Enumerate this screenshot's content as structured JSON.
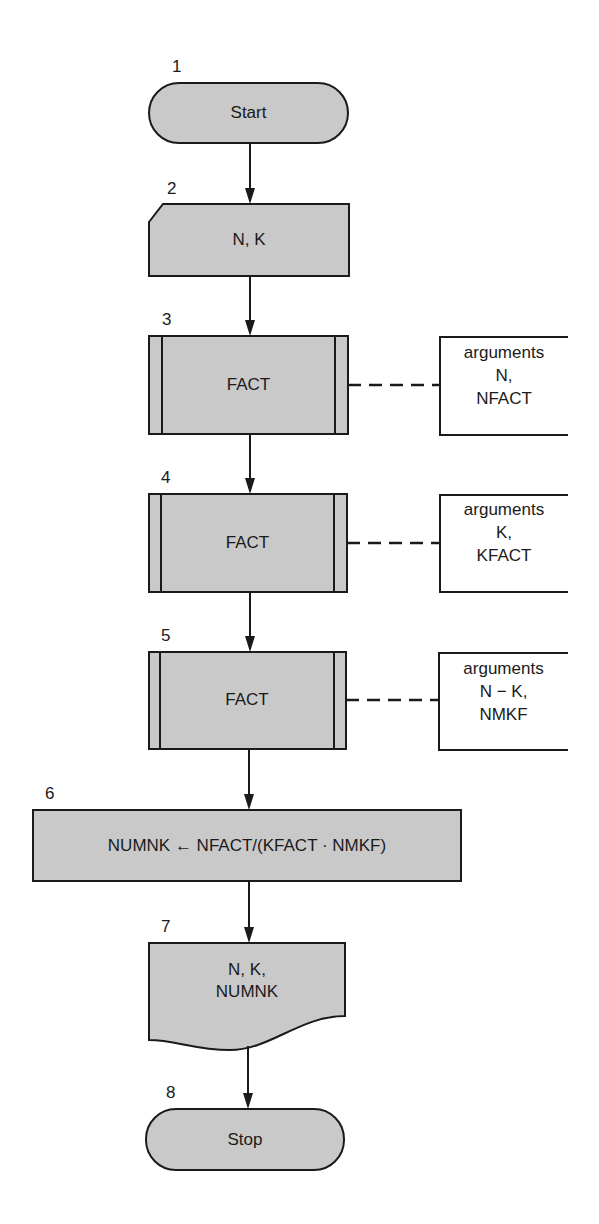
{
  "diagram": {
    "type": "flowchart",
    "colors": {
      "fill": "#c9c9c9",
      "stroke": "#1a1a1a",
      "background": "#ffffff"
    },
    "nodes": [
      {
        "id": 1,
        "number": "1",
        "shape": "terminal",
        "text": "Start"
      },
      {
        "id": 2,
        "number": "2",
        "shape": "input-card",
        "text": "N, K"
      },
      {
        "id": 3,
        "number": "3",
        "shape": "predefined-process",
        "text": "FACT",
        "annotation": {
          "line1": "arguments",
          "line2": "N,",
          "line3": "NFACT"
        }
      },
      {
        "id": 4,
        "number": "4",
        "shape": "predefined-process",
        "text": "FACT",
        "annotation": {
          "line1": "arguments",
          "line2": "K,",
          "line3": "KFACT"
        }
      },
      {
        "id": 5,
        "number": "5",
        "shape": "predefined-process",
        "text": "FACT",
        "annotation": {
          "line1": "arguments",
          "line2": "N − K,",
          "line3": "NMKF"
        }
      },
      {
        "id": 6,
        "number": "6",
        "shape": "process",
        "text": "NUMNK ← NFACT/(KFACT · NMKF)"
      },
      {
        "id": 7,
        "number": "7",
        "shape": "document-output",
        "line1": "N, K,",
        "line2": "NUMNK"
      },
      {
        "id": 8,
        "number": "8",
        "shape": "terminal",
        "text": "Stop"
      }
    ],
    "edges": [
      {
        "from": 1,
        "to": 2
      },
      {
        "from": 2,
        "to": 3
      },
      {
        "from": 3,
        "to": 4
      },
      {
        "from": 4,
        "to": 5
      },
      {
        "from": 5,
        "to": 6
      },
      {
        "from": 6,
        "to": 7
      },
      {
        "from": 7,
        "to": 8
      }
    ]
  }
}
